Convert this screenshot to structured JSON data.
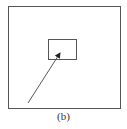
{
  "diagram": {
    "caption": "(b)",
    "colors": {
      "stroke": "#555555",
      "arrow": "#444444",
      "background": "#ffffff"
    },
    "outer_box": {
      "x": 8,
      "y": 6,
      "width": 112,
      "height": 102
    },
    "inner_box": {
      "x": 48,
      "y": 39,
      "width": 28,
      "height": 20
    },
    "arrow": {
      "x1": 28,
      "y1": 103,
      "x2": 61,
      "y2": 52
    }
  }
}
